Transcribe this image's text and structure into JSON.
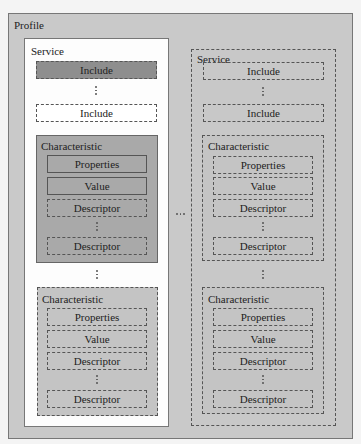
{
  "diagram": {
    "profile": {
      "label": "Profile"
    },
    "left_service": {
      "label": "Service",
      "includes": [
        {
          "label": "Include",
          "style": "dashed-filled-dark"
        },
        {
          "label": "Include",
          "style": "dashed-white"
        }
      ],
      "characteristics": [
        {
          "label": "Characteristic",
          "style": "solid",
          "items": [
            {
              "label": "Properties",
              "style": "solid"
            },
            {
              "label": "Value",
              "style": "solid"
            },
            {
              "label": "Descriptor",
              "style": "dashed"
            },
            {
              "label": "Descriptor",
              "style": "dashed"
            }
          ]
        },
        {
          "label": "Characteristic",
          "style": "dashed",
          "items": [
            {
              "label": "Properties",
              "style": "dashed"
            },
            {
              "label": "Value",
              "style": "dashed"
            },
            {
              "label": "Descriptor",
              "style": "dashed"
            },
            {
              "label": "Descriptor",
              "style": "dashed"
            }
          ]
        }
      ]
    },
    "right_service": {
      "label": "Service",
      "includes": [
        {
          "label": "Include",
          "style": "dashed"
        },
        {
          "label": "Include",
          "style": "dashed"
        }
      ],
      "characteristics": [
        {
          "label": "Characteristic",
          "style": "dashed",
          "items": [
            {
              "label": "Properties",
              "style": "dashed"
            },
            {
              "label": "Value",
              "style": "dashed"
            },
            {
              "label": "Descriptor",
              "style": "dashed"
            },
            {
              "label": "Descriptor",
              "style": "dashed"
            }
          ]
        },
        {
          "label": "Characteristic",
          "style": "dashed",
          "items": [
            {
              "label": "Properties",
              "style": "dashed"
            },
            {
              "label": "Value",
              "style": "dashed"
            },
            {
              "label": "Descriptor",
              "style": "dashed"
            },
            {
              "label": "Descriptor",
              "style": "dashed"
            }
          ]
        }
      ]
    },
    "colors": {
      "profile_bg": "#c8c8c8",
      "left_service_bg": "#ffffff",
      "right_service_bg": "#c8c8c8",
      "include_dark_bg": "#8e8e8e",
      "characteristic_solid_bg": "#a9a9a9",
      "characteristic_dashed_bg": "#c3c3c3"
    }
  }
}
